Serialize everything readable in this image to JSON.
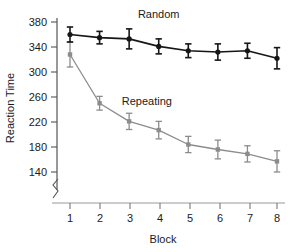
{
  "chart_data": {
    "type": "line",
    "title": "",
    "subtitle": "",
    "xlabel": "Block",
    "ylabel": "Reaction Time",
    "x": [
      1,
      2,
      3,
      4,
      5,
      6,
      7,
      8
    ],
    "xtick_labels": [
      "1",
      "2",
      "3",
      "4",
      "5",
      "6",
      "7",
      "8"
    ],
    "ytick_labels": [
      "140",
      "180",
      "220",
      "260",
      "300",
      "340",
      "380"
    ],
    "yticks": [
      140,
      180,
      220,
      260,
      300,
      340,
      380
    ],
    "ylim": [
      128,
      390
    ],
    "xlim": [
      0.55,
      8.45
    ],
    "grid": false,
    "legend_position": "inline-annotations",
    "axis_break": true,
    "axis_break_note": "y-axis broken below 140",
    "series": [
      {
        "name": "Random",
        "color": "#161616",
        "marker": "circle",
        "label_x": 4.0,
        "label_y": 386,
        "values": [
          360,
          355,
          353,
          341,
          334,
          332,
          334,
          322
        ],
        "errors": [
          12,
          10,
          16,
          12,
          11,
          13,
          12,
          17
        ]
      },
      {
        "name": "Repeating",
        "color": "#8c8c8c",
        "marker": "square",
        "label_x": 3.6,
        "label_y": 247,
        "values": [
          328,
          250,
          221,
          207,
          184,
          176,
          169,
          157
        ],
        "errors": [
          20,
          11,
          13,
          14,
          13,
          15,
          13,
          17
        ]
      }
    ]
  },
  "annotations": {
    "random_label": "Random",
    "repeating_label": "Repeating"
  }
}
